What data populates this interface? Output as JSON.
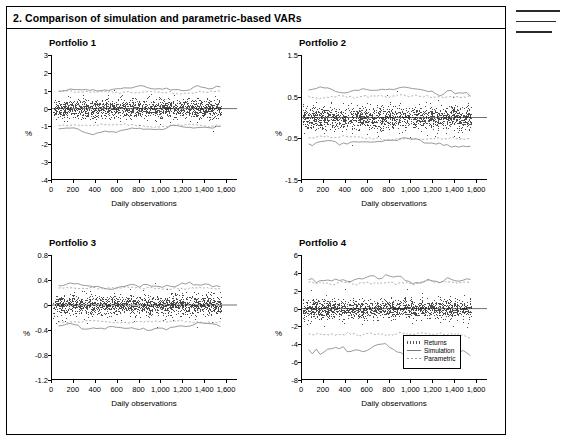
{
  "figure": {
    "title": "2. Comparison of simulation and parametric-based VARs"
  },
  "legend": {
    "items": [
      {
        "label": "Returns",
        "style": "dots",
        "color": "#555555"
      },
      {
        "label": "Simulation",
        "style": "line",
        "color": "#777777"
      },
      {
        "label": "Parametric",
        "style": "dashed",
        "color": "#999999"
      }
    ]
  },
  "chart_data": [
    {
      "type": "scatter",
      "title": "Portfolio 1",
      "xlabel": "Daily observations",
      "ylabel": "%",
      "xlim": [
        0,
        1700
      ],
      "ylim": [
        -4,
        3
      ],
      "xticks": [
        0,
        200,
        400,
        600,
        800,
        1000,
        1200,
        1400,
        1600
      ],
      "xticklabels": [
        "0",
        "200",
        "400",
        "600",
        "800",
        "1,000",
        "1,200",
        "1,400",
        "1,600"
      ],
      "yticks": [
        -4,
        -3,
        -2,
        -1,
        0,
        1,
        2,
        3
      ],
      "yticklabels": [
        "-4",
        "-3",
        "-2",
        "-1",
        "0",
        "1",
        "2",
        "3"
      ],
      "grid": false,
      "returns_spread": 0.55,
      "returns_mean": 0.0,
      "series": [
        {
          "name": "Simulation",
          "upper_mean": 1.05,
          "lower_mean": -1.1
        },
        {
          "name": "Parametric",
          "upper_mean": 0.95,
          "lower_mean": -0.95
        }
      ]
    },
    {
      "type": "scatter",
      "title": "Portfolio 2",
      "xlabel": "Daily observations",
      "ylabel": "%",
      "xlim": [
        0,
        1700
      ],
      "ylim": [
        -1.5,
        1.5
      ],
      "xticks": [
        0,
        200,
        400,
        600,
        800,
        1000,
        1200,
        1400,
        1600
      ],
      "xticklabels": [
        "0",
        "200",
        "400",
        "600",
        "800",
        "1,000",
        "1,200",
        "1,400",
        "1,600"
      ],
      "yticks": [
        -1.5,
        -0.5,
        0.5,
        1.5
      ],
      "yticklabels": [
        "-1.5",
        "-0.5",
        "0.5",
        "1.5"
      ],
      "grid": false,
      "returns_spread": 0.28,
      "returns_mean": 0.0,
      "series": [
        {
          "name": "Simulation",
          "upper_mean": 0.62,
          "lower_mean": -0.6
        },
        {
          "name": "Parametric",
          "upper_mean": 0.5,
          "lower_mean": -0.5
        }
      ]
    },
    {
      "type": "scatter",
      "title": "Portfolio 3",
      "xlabel": "Daily observations",
      "ylabel": "%",
      "xlim": [
        0,
        1700
      ],
      "ylim": [
        -1.2,
        0.8
      ],
      "xticks": [
        0,
        200,
        400,
        600,
        800,
        1000,
        1200,
        1400,
        1600
      ],
      "xticklabels": [
        "0",
        "200",
        "400",
        "600",
        "800",
        "1,000",
        "1,200",
        "1,400",
        "1,600"
      ],
      "yticks": [
        -1.2,
        -0.8,
        -0.4,
        0,
        0.4,
        0.8
      ],
      "yticklabels": [
        "-1.2",
        "-0.8",
        "-0.4",
        "0",
        "0.4",
        "0.8"
      ],
      "grid": false,
      "returns_spread": 0.16,
      "returns_mean": 0.0,
      "series": [
        {
          "name": "Simulation",
          "upper_mean": 0.3,
          "lower_mean": -0.33
        },
        {
          "name": "Parametric",
          "upper_mean": 0.27,
          "lower_mean": -0.27
        }
      ]
    },
    {
      "type": "scatter",
      "title": "Portfolio 4",
      "xlabel": "Daily observations",
      "ylabel": "%",
      "xlim": [
        0,
        1700
      ],
      "ylim": [
        -8,
        6
      ],
      "xticks": [
        0,
        200,
        400,
        600,
        800,
        1000,
        1200,
        1400,
        1600
      ],
      "xticklabels": [
        "0",
        "200",
        "400",
        "600",
        "800",
        "1,000",
        "1,200",
        "1,400",
        "1,600"
      ],
      "yticks": [
        -8,
        -6,
        -4,
        -2,
        0,
        2,
        4,
        6
      ],
      "yticklabels": [
        "-8",
        "-6",
        "-4",
        "-2",
        "0",
        "2",
        "4",
        "6"
      ],
      "grid": false,
      "returns_spread": 1.1,
      "returns_mean": 0.0,
      "series": [
        {
          "name": "Simulation",
          "upper_mean": 3.2,
          "lower_mean": -4.6
        },
        {
          "name": "Parametric",
          "upper_mean": 2.9,
          "lower_mean": -2.9
        }
      ]
    }
  ]
}
